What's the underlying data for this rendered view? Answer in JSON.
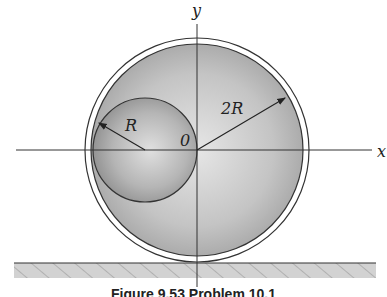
{
  "figure": {
    "labels": {
      "y_axis": "y",
      "x_axis": "x",
      "origin": "0",
      "small_radius": "R",
      "large_radius": "2R"
    },
    "caption": "Figure 9.53 Problem 10.1"
  }
}
